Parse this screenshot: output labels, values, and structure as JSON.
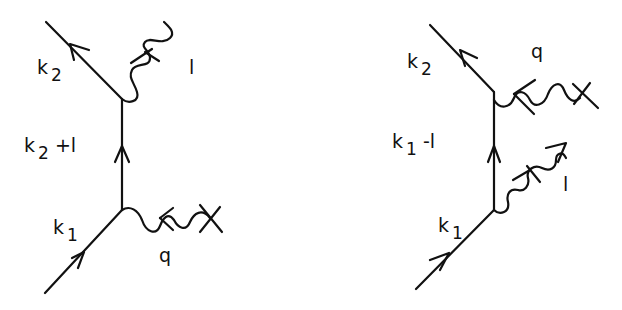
{
  "diagrams": [
    {
      "name": "left",
      "labels": {
        "outgoing_fermion": {
          "base": "k",
          "sub": "2"
        },
        "propagator": {
          "base": "k",
          "sub": "2",
          "suffix": " +l"
        },
        "incoming_fermion": {
          "base": "k",
          "sub": "1"
        },
        "upper_boson": "l",
        "lower_boson": "q"
      }
    },
    {
      "name": "right",
      "labels": {
        "outgoing_fermion": {
          "base": "k",
          "sub": "2"
        },
        "propagator": {
          "base": "k",
          "sub": "1",
          "suffix": " -l"
        },
        "incoming_fermion": {
          "base": "k",
          "sub": "1"
        },
        "upper_boson": "q",
        "lower_boson": "l"
      }
    }
  ],
  "colors": {
    "ink": "#111111",
    "background": "#ffffff"
  }
}
